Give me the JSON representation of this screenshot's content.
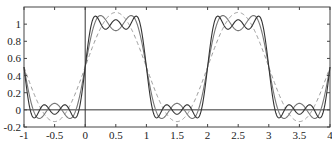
{
  "chart_data": {
    "type": "line",
    "title": "",
    "xlabel": "",
    "ylabel": "",
    "xlim": [
      -1,
      4
    ],
    "ylim": [
      -0.2,
      1.2
    ],
    "grid": false,
    "x_ticks": [
      -1,
      -0.5,
      0,
      0.5,
      1,
      1.5,
      2,
      2.5,
      3,
      3.5,
      4
    ],
    "x_tick_labels": [
      "-1",
      "-0.5",
      "0",
      "0.5",
      "1",
      "1.5",
      "2",
      "2.5",
      "3",
      "3.5",
      "4"
    ],
    "y_ticks": [
      -0.2,
      0,
      0.2,
      0.4,
      0.6,
      0.8,
      1
    ],
    "y_tick_labels": [
      "-0.2",
      "0",
      "0.2",
      "0.4",
      "0.6",
      "0.8",
      "1"
    ],
    "reference_lines": [
      {
        "axis": "y",
        "value": 0
      },
      {
        "axis": "x",
        "value": 0
      }
    ],
    "series": [
      {
        "name": "Fourier partial sum, 1 term",
        "style": "dashed",
        "color": "#999999",
        "formula": "0.5 + (2/pi)*sin(pi x)",
        "terms": 1
      },
      {
        "name": "Fourier partial sum, 2 terms",
        "style": "solid",
        "color": "#777777",
        "formula": "0.5 + (2/pi)*(sin(pi x) + sin(3 pi x)/3)",
        "terms": 2
      },
      {
        "name": "Fourier partial sum, 3 terms",
        "style": "solid",
        "color": "#333333",
        "formula": "0.5 + (2/pi)*(sin(pi x) + sin(3 pi x)/3 + sin(5 pi x)/5)",
        "terms": 3
      }
    ],
    "legend": null
  }
}
